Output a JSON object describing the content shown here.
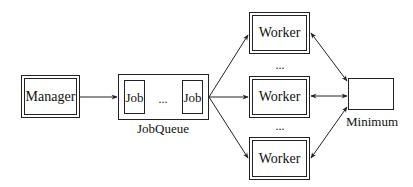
{
  "diagram": {
    "manager": {
      "label": "Manager"
    },
    "job_queue": {
      "caption": "JobQueue",
      "jobs": [
        {
          "label": "Job"
        },
        {
          "label": "Job"
        }
      ],
      "ellipsis": "..."
    },
    "workers": [
      {
        "label": "Worker"
      },
      {
        "label": "Worker"
      },
      {
        "label": "Worker"
      }
    ],
    "worker_ellipses": [
      "...",
      "..."
    ],
    "minimum": {
      "caption": "Minimum"
    },
    "edges": [
      {
        "from": "Manager",
        "to": "JobQueue",
        "type": "directed"
      },
      {
        "from": "JobQueue",
        "to": "Worker 1",
        "type": "directed"
      },
      {
        "from": "JobQueue",
        "to": "Worker 2",
        "type": "directed"
      },
      {
        "from": "JobQueue",
        "to": "Worker 3",
        "type": "directed"
      },
      {
        "from": "Worker 1",
        "to": "Minimum",
        "type": "bidirectional"
      },
      {
        "from": "Worker 2",
        "to": "Minimum",
        "type": "bidirectional"
      },
      {
        "from": "Worker 3",
        "to": "Minimum",
        "type": "bidirectional"
      }
    ]
  }
}
